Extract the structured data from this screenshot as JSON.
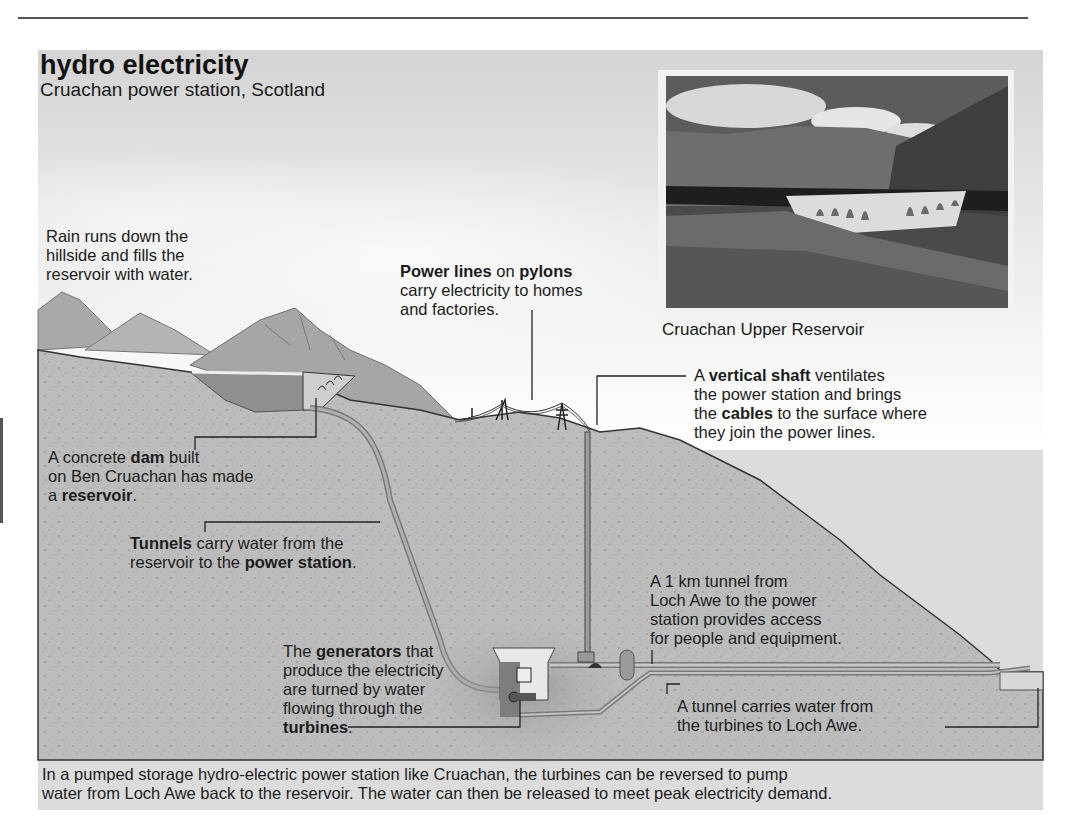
{
  "header": {
    "title": "hydro electricity",
    "subtitle": "Cruachan power station, Scotland"
  },
  "photo": {
    "caption": "Cruachan Upper Reservoir",
    "subject": "photograph of dam with buttress arches below mountains and clouds"
  },
  "labels": {
    "rain": {
      "lines": [
        "Rain runs down the",
        "hillside and fills the",
        "reservoir with water."
      ]
    },
    "power_lines": {
      "bold1": "Power lines",
      "mid": " on ",
      "bold2": "pylons",
      "line2": "carry electricity to homes",
      "line3": "and factories."
    },
    "vertical_shaft": {
      "pre": "A ",
      "bold1": "vertical shaft",
      "post1": " ventilates",
      "line2": "the power station and brings",
      "pre3": "the ",
      "bold3": "cables",
      "post3": " to the surface where",
      "line4": "they join the power lines."
    },
    "dam": {
      "pre": "A concrete ",
      "bold1": "dam",
      "post1": " built",
      "line2": "on Ben Cruachan has made",
      "pre3": "a ",
      "bold3": "reservoir",
      "post3": "."
    },
    "tunnels": {
      "bold1": "Tunnels",
      "post1": " carry water from the",
      "pre2": "reservoir to the ",
      "bold2": "power station",
      "post2": "."
    },
    "access_tunnel": {
      "lines": [
        "A 1 km tunnel from",
        "Loch Awe to the power",
        "station provides access",
        "for people and equipment."
      ]
    },
    "generators": {
      "pre": "The ",
      "bold1": "generators",
      "post1": " that",
      "line2": "produce the electricity",
      "line3": "are turned by water",
      "line4": "flowing through the",
      "bold5": "turbines",
      "post5": "."
    },
    "tailrace": {
      "lines": [
        "A tunnel carries water from",
        "the turbines to Loch Awe."
      ]
    }
  },
  "footer": {
    "lines": [
      "In a pumped storage hydro-electric power station like Cruachan, the turbines can be reversed to pump",
      "water from Loch Awe back to the  reservoir. The water can then be released to meet peak electricity demand."
    ]
  },
  "colors": {
    "panel": "#dcdcdc",
    "ground": "#bdbdbd",
    "water": "#9a9a9a",
    "tunnel": "#a8a8a8",
    "leader_line": "#222222"
  }
}
